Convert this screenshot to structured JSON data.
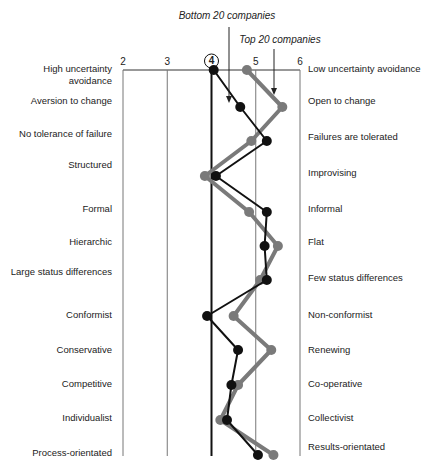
{
  "chart_data": {
    "type": "line",
    "orientation": "vertical-profile",
    "title": "",
    "xlabel": "",
    "ylabel": "",
    "x_ticks": [
      2,
      3,
      4,
      5,
      6
    ],
    "highlighted_tick": 4,
    "xlim": [
      2,
      6
    ],
    "grid": "vertical lines at each tick",
    "dimensions": [
      {
        "left": "High uncertainty avoidance",
        "right": "Low uncertainty avoidance"
      },
      {
        "left": "Aversion to change",
        "right": "Open to change"
      },
      {
        "left": "No tolerance of failure",
        "right": "Failures are tolerated"
      },
      {
        "left": "Structured",
        "right": "Improvising"
      },
      {
        "left": "Formal",
        "right": "Informal"
      },
      {
        "left": "Hierarchic",
        "right": "Flat"
      },
      {
        "left": "Large status differences",
        "right": "Few status differences"
      },
      {
        "left": "Conformist",
        "right": "Non-conformist"
      },
      {
        "left": "Conservative",
        "right": "Renewing"
      },
      {
        "left": "Competitive",
        "right": "Co-operative"
      },
      {
        "left": "Individualist",
        "right": "Collectivist"
      },
      {
        "left": "Process-orientated",
        "right": "Results-orientated"
      }
    ],
    "series": [
      {
        "name": "Bottom 20 companies",
        "color": "#111111",
        "values": [
          4.05,
          4.65,
          5.25,
          4.1,
          5.25,
          5.2,
          5.25,
          3.9,
          4.6,
          4.45,
          4.35,
          5.05
        ]
      },
      {
        "name": "Top 20 companies",
        "color": "#7a7a7a",
        "values": [
          4.8,
          5.6,
          4.9,
          3.85,
          4.85,
          5.5,
          5.1,
          4.5,
          5.35,
          4.6,
          4.2,
          5.4
        ]
      }
    ],
    "annotations": [
      {
        "text": "Bottom 20 companies",
        "points_to": "Bottom 20 companies line"
      },
      {
        "text": "Top 20 companies",
        "points_to": "Top 20 companies line"
      }
    ]
  }
}
